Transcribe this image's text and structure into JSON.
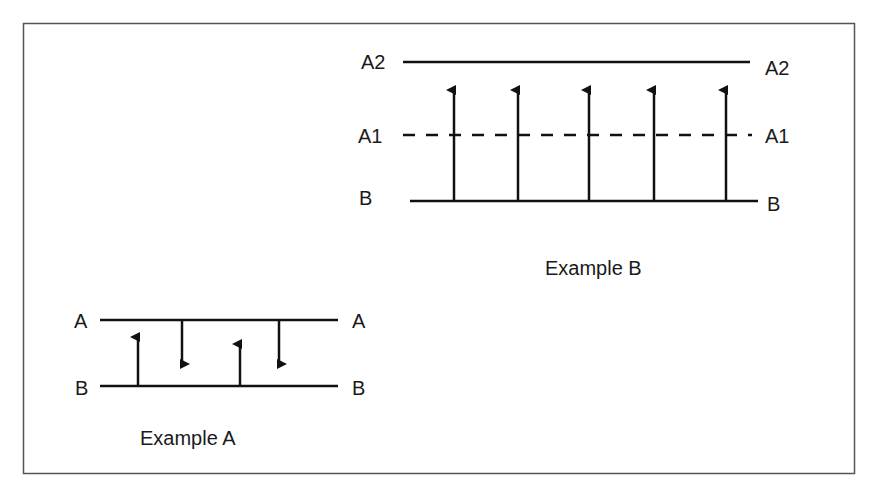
{
  "figure": {
    "border_color": "#555555",
    "line_color": "#111111",
    "background": "#ffffff"
  },
  "example_b": {
    "caption": "Example B",
    "levels": [
      {
        "name": "A2",
        "left_label": "A2",
        "right_label": "A2",
        "style": "solid"
      },
      {
        "name": "A1",
        "left_label": "A1",
        "right_label": "A1",
        "style": "dashed"
      },
      {
        "name": "B",
        "left_label": "B",
        "right_label": "B",
        "style": "solid"
      }
    ],
    "arrows": [
      {
        "direction": "up",
        "from": "B",
        "to": "above A1"
      },
      {
        "direction": "up",
        "from": "B",
        "to": "above A1"
      },
      {
        "direction": "up",
        "from": "B",
        "to": "above A1"
      },
      {
        "direction": "up",
        "from": "B",
        "to": "above A1"
      },
      {
        "direction": "up",
        "from": "B",
        "to": "above A1"
      }
    ]
  },
  "example_a": {
    "caption": "Example A",
    "levels": [
      {
        "name": "A",
        "left_label": "A",
        "right_label": "A",
        "style": "solid"
      },
      {
        "name": "B",
        "left_label": "B",
        "right_label": "B",
        "style": "solid"
      }
    ],
    "arrows": [
      {
        "direction": "up",
        "from": "B"
      },
      {
        "direction": "down",
        "from": "A"
      },
      {
        "direction": "up",
        "from": "B"
      },
      {
        "direction": "down",
        "from": "A"
      }
    ]
  }
}
